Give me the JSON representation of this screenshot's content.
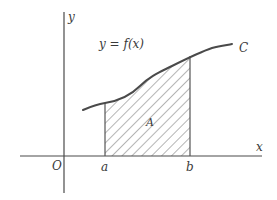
{
  "diagram": {
    "type": "area-under-curve",
    "labels": {
      "y_axis": "y",
      "x_axis": "x",
      "origin": "O",
      "lower_bound": "a",
      "upper_bound": "b",
      "function": "y = f(x)",
      "curve": "C",
      "area": "A"
    },
    "colors": {
      "ink": "#4a4a4a",
      "background": "#ffffff"
    }
  }
}
